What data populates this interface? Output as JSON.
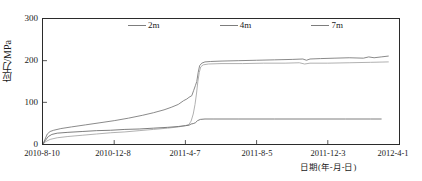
{
  "chart_data": {
    "type": "line",
    "title": "",
    "xlabel": "日期(年-月-日)",
    "ylabel": "应力/MPa",
    "ylim": [
      0,
      300
    ],
    "yticks": [
      0,
      100,
      200,
      300
    ],
    "xticks": [
      "2010-8-10",
      "2010-12-8",
      "2011-4-7",
      "2011-8-5",
      "2011-12-3",
      "2012-4-1"
    ],
    "grid": false,
    "legend_position": "top-center",
    "legend": [
      "2m",
      "4m",
      "7m"
    ],
    "series": [
      {
        "name": "2m",
        "color": "#7d7d7d",
        "points": [
          [
            0.0,
            0
          ],
          [
            0.6,
            12
          ],
          [
            1.2,
            24
          ],
          [
            2.0,
            30
          ],
          [
            3.0,
            33
          ],
          [
            5.0,
            37
          ],
          [
            8.0,
            41
          ],
          [
            12.0,
            46
          ],
          [
            16.0,
            51
          ],
          [
            20.0,
            56
          ],
          [
            24.0,
            62
          ],
          [
            28.0,
            69
          ],
          [
            31.0,
            75
          ],
          [
            34.0,
            82
          ],
          [
            36.0,
            88
          ],
          [
            38.0,
            95
          ],
          [
            39.5,
            104
          ],
          [
            40.4,
            108
          ],
          [
            41.0,
            112
          ],
          [
            41.8,
            116
          ],
          [
            42.3,
            128
          ],
          [
            42.8,
            140
          ],
          [
            43.2,
            150
          ],
          [
            43.6,
            172
          ],
          [
            44.0,
            188
          ],
          [
            44.6,
            194
          ],
          [
            45.5,
            197
          ],
          [
            47.0,
            198
          ],
          [
            50.0,
            199
          ],
          [
            55.0,
            200
          ],
          [
            60.0,
            201
          ],
          [
            65.0,
            202
          ],
          [
            70.0,
            203
          ],
          [
            73.0,
            204
          ],
          [
            74.0,
            201
          ],
          [
            75.0,
            204
          ],
          [
            78.0,
            205
          ],
          [
            82.0,
            206
          ],
          [
            86.0,
            207
          ],
          [
            90.0,
            206
          ],
          [
            91.5,
            209
          ],
          [
            93.0,
            207
          ],
          [
            95.0,
            209
          ],
          [
            97.0,
            211
          ]
        ]
      },
      {
        "name": "4m",
        "color": "#a8a8a8",
        "points": [
          [
            0.0,
            0
          ],
          [
            0.8,
            6
          ],
          [
            2.0,
            11
          ],
          [
            4.0,
            15
          ],
          [
            7.0,
            18
          ],
          [
            11.0,
            21
          ],
          [
            15.0,
            24
          ],
          [
            19.0,
            27
          ],
          [
            23.0,
            29
          ],
          [
            27.0,
            32
          ],
          [
            31.0,
            35
          ],
          [
            35.0,
            38
          ],
          [
            38.0,
            41
          ],
          [
            40.0,
            44
          ],
          [
            41.0,
            47
          ],
          [
            41.6,
            55
          ],
          [
            42.2,
            72
          ],
          [
            42.7,
            95
          ],
          [
            43.1,
            120
          ],
          [
            43.5,
            150
          ],
          [
            43.9,
            172
          ],
          [
            44.3,
            185
          ],
          [
            45.0,
            190
          ],
          [
            46.5,
            192
          ],
          [
            50.0,
            193
          ],
          [
            56.0,
            193
          ],
          [
            62.0,
            194
          ],
          [
            68.0,
            194
          ],
          [
            72.0,
            195
          ],
          [
            73.5,
            192
          ],
          [
            75.0,
            194
          ],
          [
            80.0,
            194
          ],
          [
            86.0,
            195
          ],
          [
            92.0,
            196
          ],
          [
            97.0,
            197
          ]
        ]
      },
      {
        "name": "7m",
        "color": "#6f6f6f",
        "points": [
          [
            0.0,
            0
          ],
          [
            0.7,
            9
          ],
          [
            1.5,
            18
          ],
          [
            2.5,
            23
          ],
          [
            4.0,
            26
          ],
          [
            7.0,
            28
          ],
          [
            11.0,
            30
          ],
          [
            15.0,
            32
          ],
          [
            19.0,
            33
          ],
          [
            23.0,
            35
          ],
          [
            27.0,
            36
          ],
          [
            31.0,
            38
          ],
          [
            35.0,
            40
          ],
          [
            38.0,
            42
          ],
          [
            40.0,
            44
          ],
          [
            41.0,
            45
          ],
          [
            41.6,
            48
          ],
          [
            42.2,
            49
          ],
          [
            42.8,
            51
          ],
          [
            43.4,
            56
          ],
          [
            44.2,
            59
          ],
          [
            45.5,
            60
          ],
          [
            48.0,
            60
          ],
          [
            55.0,
            60
          ],
          [
            65.0,
            60
          ],
          [
            75.0,
            60
          ],
          [
            85.0,
            60
          ],
          [
            92.0,
            60
          ],
          [
            95.0,
            60
          ]
        ]
      }
    ]
  },
  "axes": {
    "y_label": "应力/MPa",
    "y_ticks": [
      "300",
      "200",
      "100",
      "0"
    ],
    "x_ticks": [
      "2010-8-10",
      "2010-12-8",
      "2011-4-7",
      "2011-8-5",
      "2011-12-3",
      "2012-4-1"
    ],
    "x_label": "日期(年-月-日)"
  },
  "legend": {
    "items": [
      {
        "label": "2m"
      },
      {
        "label": "4m"
      },
      {
        "label": "7m"
      }
    ]
  },
  "colors": {
    "axis": "#2b2b2b",
    "series_2m": "#7d7d7d",
    "series_4m": "#a8a8a8",
    "series_7m": "#6f6f6f",
    "background": "#ffffff"
  }
}
